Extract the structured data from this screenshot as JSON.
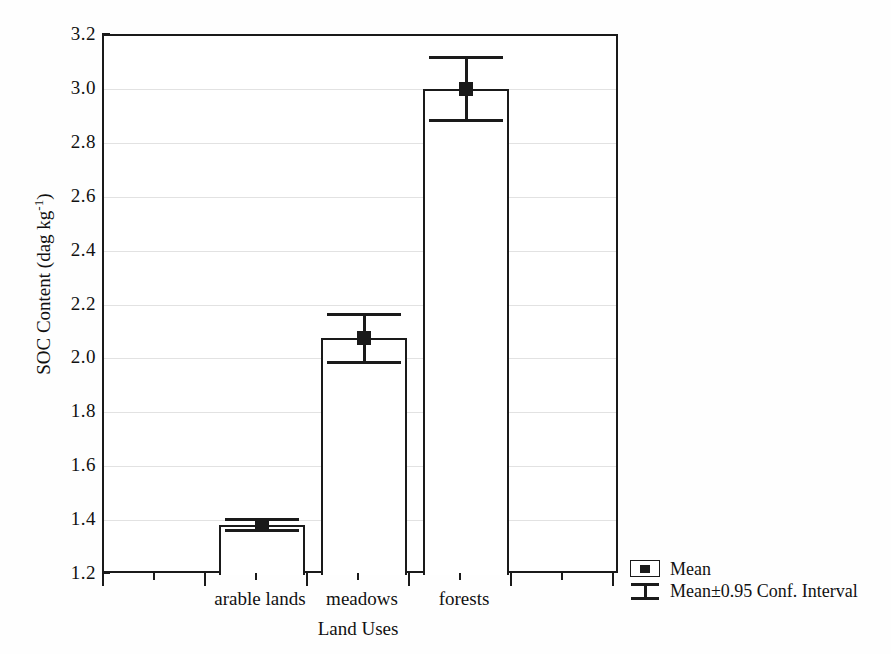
{
  "chart_data": {
    "type": "bar",
    "title": "",
    "xlabel": "Land Uses",
    "ylabel": "SOC Content (dag kg-1)",
    "ylabel_main": "SOC Content (dag kg",
    "ylabel_sup": "-1",
    "ylabel_tail": ")",
    "categories": [
      "arable lands",
      "meadows",
      "forests"
    ],
    "values": [
      1.385,
      2.08,
      3.005
    ],
    "error_low": [
      1.365,
      1.99,
      2.888
    ],
    "error_high": [
      1.405,
      2.168,
      3.122
    ],
    "bar_tops": [
      1.385,
      2.08,
      3.005
    ],
    "ylim": [
      1.2,
      3.2
    ],
    "yticks": [
      "3.2",
      "3.0",
      "2.8",
      "2.6",
      "2.4",
      "2.2",
      "2.0",
      "1.8",
      "1.6",
      "1.4",
      "1.2"
    ],
    "ytick_values": [
      3.2,
      3.0,
      2.8,
      2.6,
      2.4,
      2.2,
      2.0,
      1.8,
      1.6,
      1.4,
      1.2
    ],
    "grid": true,
    "legend_position": "bottom-right",
    "series": [
      {
        "name": "Mean",
        "values": [
          1.385,
          2.08,
          3.005
        ]
      },
      {
        "name": "Mean±0.95 Conf. Interval",
        "low": [
          1.365,
          1.99,
          2.888
        ],
        "high": [
          1.405,
          2.168,
          3.122
        ]
      }
    ],
    "colors": {
      "bar_fill": "#ffffff",
      "bar_edge": "#1a1a1a",
      "marker": "#1a1a1a",
      "grid": "#e2e2e2",
      "background": "#ffffff"
    }
  },
  "legend": {
    "items": [
      {
        "label": "Mean",
        "key": "filled-square-marker"
      },
      {
        "label": "Mean±0.95 Conf. Interval",
        "key": "error-bar-marker"
      }
    ]
  }
}
